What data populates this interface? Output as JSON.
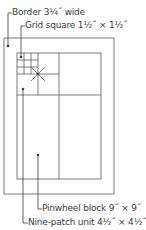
{
  "diagram": {
    "colors": {
      "line": "#5a5a5a",
      "leader": "#3a3a3a",
      "text": "#3a3a3a",
      "background": "#ffffff"
    },
    "labels": {
      "border": "Border 3¼˝ wide",
      "grid_square": "Grid square 1½˝ × 1½˝",
      "pinwheel_block": "Pinwheel block 9˝ × 9˝",
      "nine_patch_unit": "Nine-patch unit 4½˝ × 4½˝"
    }
  }
}
